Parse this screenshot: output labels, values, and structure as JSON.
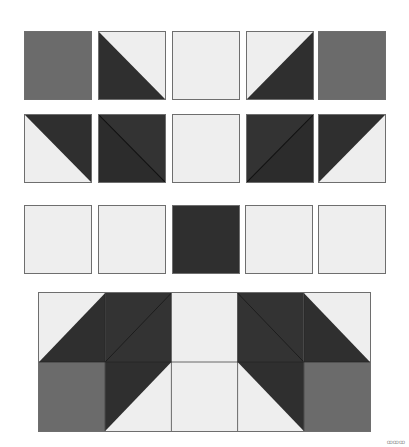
{
  "colors": {
    "light": "#eeeeee",
    "medium": "#6b6b6b",
    "dark": "#2f2f2f",
    "border": "#6e6e6e"
  },
  "rows": [
    {
      "name": "row-1",
      "pieces": [
        "medium-square",
        "hst-dark-bottom-left",
        "light-square",
        "hst-dark-bottom-right",
        "medium-square"
      ]
    },
    {
      "name": "row-2",
      "pieces": [
        "hst-dark-top-right",
        "hst-dark-dark-diag-down",
        "light-square",
        "hst-dark-dark-diag-up",
        "hst-dark-top-left"
      ]
    },
    {
      "name": "row-3",
      "pieces": [
        "light-square",
        "light-square",
        "dark-square",
        "light-square",
        "light-square"
      ]
    }
  ],
  "assembled_block": {
    "columns": 5,
    "rows": 2,
    "top_row": [
      "hst-dark-bottom-right",
      "hst-dark-dark-diag-up",
      "light-square",
      "hst-dark-dark-diag-down",
      "hst-dark-bottom-left"
    ],
    "bottom_row": [
      "medium-square",
      "hst-dark-top-left",
      "light-square",
      "hst-dark-top-right",
      "medium-square"
    ]
  },
  "watermark": "ꝏꝏꝏ"
}
